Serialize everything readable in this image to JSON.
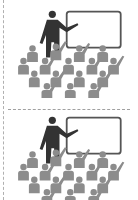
{
  "panels": [
    {
      "icon": "classroom-presentation-icon"
    },
    {
      "icon": "classroom-presentation-icon"
    }
  ],
  "colors": {
    "teacher": "#333333",
    "board": "#555555",
    "audience": "#8c8c8c",
    "divider": "#a0a0a0"
  }
}
